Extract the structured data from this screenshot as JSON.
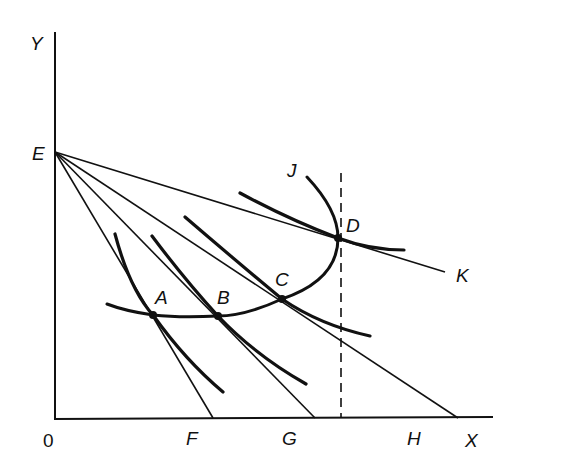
{
  "diagram": {
    "type": "indifference-curve / price-consumption diagram",
    "axes": {
      "y_label": "Y",
      "x_label": "X",
      "origin_label": "0"
    },
    "intercepts": {
      "y_intercept": "E",
      "x_intercepts": [
        "F",
        "G",
        "H"
      ]
    },
    "budget_lines": [
      {
        "from": "E",
        "to": "F"
      },
      {
        "from": "E",
        "to": "G"
      },
      {
        "from": "E",
        "to": "H"
      },
      {
        "from": "E",
        "to": "K"
      }
    ],
    "tangency_points": [
      {
        "label": "A"
      },
      {
        "label": "B"
      },
      {
        "label": "C"
      },
      {
        "label": "D"
      }
    ],
    "curve_labels": {
      "price_consumption_curve_end": "J",
      "budget_line_end": "K"
    },
    "dashed_line": "vertical line through D"
  }
}
